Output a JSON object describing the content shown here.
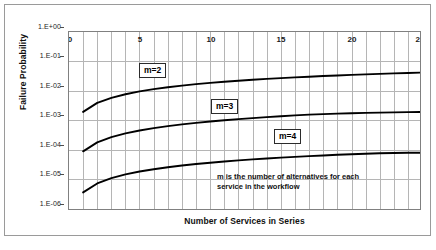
{
  "chart_data": {
    "type": "line",
    "title": "",
    "xlabel": "Number of Services in Series",
    "ylabel": "Failure Probability",
    "xlim": [
      0,
      25
    ],
    "ylim": [
      1e-06,
      1
    ],
    "yscale": "log",
    "xscale": "linear",
    "grid": true,
    "legend_position": "inline-labels",
    "x_ticks": [
      "0",
      "5",
      "10",
      "15",
      "20",
      "25"
    ],
    "x_tick_values": [
      0,
      5,
      10,
      15,
      20,
      25
    ],
    "x_minor_step": 1,
    "y_ticks": [
      "1.E+00",
      "1.E-01",
      "1.E-02",
      "1.E-03",
      "1.E-04",
      "1.E-05",
      "1.E-06"
    ],
    "y_tick_values": [
      1,
      0.1,
      0.01,
      0.001,
      0.0001,
      1e-05,
      1e-06
    ],
    "x": [
      1,
      2,
      3,
      4,
      5,
      6,
      7,
      8,
      9,
      10,
      11,
      12,
      13,
      14,
      15,
      16,
      17,
      18,
      19,
      20,
      21,
      22,
      23,
      24,
      25
    ],
    "series": [
      {
        "name": "m=2",
        "label": "m=2",
        "color": "#000000",
        "values": [
          0.0021,
          0.0042,
          0.0062,
          0.0082,
          0.0102,
          0.0122,
          0.0141,
          0.016,
          0.0179,
          0.0197,
          0.0215,
          0.0233,
          0.0251,
          0.0268,
          0.0285,
          0.0302,
          0.0318,
          0.0334,
          0.035,
          0.0365,
          0.038,
          0.0395,
          0.041,
          0.0424,
          0.0438
        ]
      },
      {
        "name": "m=3",
        "label": "m=3",
        "color": "#000000",
        "values": [
          0.0001,
          0.0002,
          0.0003,
          0.0004,
          0.0005,
          0.0006,
          0.0007,
          0.0008,
          0.0009,
          0.001,
          0.0011,
          0.0012,
          0.0013,
          0.0014,
          0.0015,
          0.0016,
          0.0017,
          0.00177,
          0.00183,
          0.00189,
          0.00194,
          0.00198,
          0.00202,
          0.00206,
          0.0021
        ]
      },
      {
        "name": "m=4",
        "label": "m=4",
        "color": "#000000",
        "values": [
          4.2e-06,
          8.4e-06,
          1.26e-05,
          1.68e-05,
          2.1e-05,
          2.52e-05,
          2.93e-05,
          3.34e-05,
          3.75e-05,
          4.16e-05,
          4.56e-05,
          4.96e-05,
          5.36e-05,
          5.75e-05,
          6.14e-05,
          6.52e-05,
          6.9e-05,
          7.27e-05,
          7.64e-05,
          8e-05,
          8.32e-05,
          8.58e-05,
          8.78e-05,
          8.92e-05,
          9e-05
        ]
      }
    ],
    "annotations": [
      {
        "name": "m-definition-note",
        "line1": "m is the number of alternatives for each",
        "line2": "service in the workflow"
      }
    ]
  },
  "labels": {
    "series_m2": "m=2",
    "series_m3": "m=3",
    "series_m4": "m=4",
    "y_title": "Failure Probability",
    "x_title": "Number of Services in Series",
    "y0": "1.E+00",
    "y1": "1.E-01",
    "y2": "1.E-02",
    "y3": "1.E-03",
    "y4": "1.E-04",
    "y5": "1.E-05",
    "y6": "1.E-06",
    "x0": "0",
    "x5": "5",
    "x10": "10",
    "x15": "15",
    "x20": "20",
    "x25": "25",
    "note_line1": "m is the number of alternatives for each",
    "note_line2": "service in the workflow"
  }
}
